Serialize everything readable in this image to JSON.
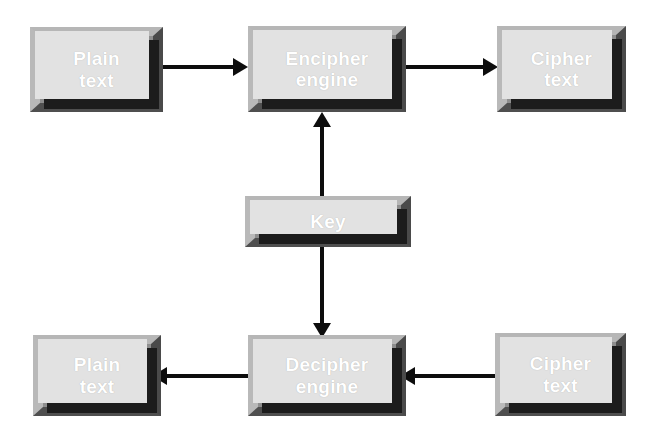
{
  "diagram": {
    "background_color": "#ffffff",
    "box_face_color": "#8e8e8e",
    "box_highlight_color": "#b8b8b8",
    "box_shadow_color": "#4a4a4a",
    "box_text_color": "#ffffff",
    "arrow_color": "#0d0d0d",
    "nodes": [
      {
        "id": "plain-text-top",
        "label": "Plain\ntext",
        "x": 30,
        "y": 27,
        "w": 133,
        "h": 85
      },
      {
        "id": "encipher-engine",
        "label": "Encipher\nengine",
        "x": 248,
        "y": 26,
        "w": 158,
        "h": 86
      },
      {
        "id": "cipher-text-top",
        "label": "Cipher\ntext",
        "x": 497,
        "y": 26,
        "w": 129,
        "h": 86
      },
      {
        "id": "key",
        "label": "Key",
        "x": 245,
        "y": 196,
        "w": 166,
        "h": 51
      },
      {
        "id": "plain-text-bottom",
        "label": "Plain\ntext",
        "x": 33,
        "y": 335,
        "w": 128,
        "h": 81
      },
      {
        "id": "decipher-engine",
        "label": "Decipher\nengine",
        "x": 248,
        "y": 335,
        "w": 158,
        "h": 81
      },
      {
        "id": "cipher-text-bottom",
        "label": "Cipher\ntext",
        "x": 495,
        "y": 333,
        "w": 131,
        "h": 83
      }
    ],
    "arrows": [
      {
        "id": "plain-to-encipher",
        "from": "plain-text-top",
        "to": "encipher-engine",
        "direction": "right",
        "x": 152,
        "y": 58,
        "w": 96,
        "h": 18
      },
      {
        "id": "encipher-to-cipher",
        "from": "encipher-engine",
        "to": "cipher-text-top",
        "direction": "right",
        "x": 400,
        "y": 58,
        "w": 98,
        "h": 18
      },
      {
        "id": "key-to-encipher",
        "from": "key",
        "to": "encipher-engine",
        "direction": "up",
        "x": 313,
        "y": 112,
        "w": 18,
        "h": 88
      },
      {
        "id": "key-to-decipher",
        "from": "key",
        "to": "decipher-engine",
        "direction": "down",
        "x": 313,
        "y": 243,
        "w": 18,
        "h": 95
      },
      {
        "id": "decipher-to-plain",
        "from": "decipher-engine",
        "to": "plain-text-bottom",
        "direction": "left",
        "x": 152,
        "y": 367,
        "w": 104,
        "h": 18
      },
      {
        "id": "cipher-to-decipher",
        "from": "cipher-text-bottom",
        "to": "decipher-engine",
        "direction": "left",
        "x": 400,
        "y": 367,
        "w": 100,
        "h": 18
      }
    ]
  }
}
